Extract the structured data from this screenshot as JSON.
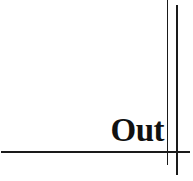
{
  "label": {
    "text": "Out"
  },
  "colors": {
    "line": "#1a1a1a",
    "text": "#111111",
    "background": "#ffffff"
  }
}
